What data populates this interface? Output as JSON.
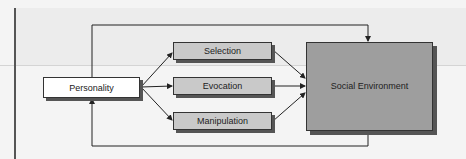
{
  "diagram": {
    "nodes": {
      "personality": "Personality",
      "selection": "Selection",
      "evocation": "Evocation",
      "manipulation": "Manipulation",
      "social_environment": "Social Environment"
    },
    "edges": [
      {
        "from": "Personality",
        "to": "Selection"
      },
      {
        "from": "Personality",
        "to": "Evocation"
      },
      {
        "from": "Personality",
        "to": "Manipulation"
      },
      {
        "from": "Selection",
        "to": "Social Environment"
      },
      {
        "from": "Evocation",
        "to": "Social Environment"
      },
      {
        "from": "Manipulation",
        "to": "Social Environment"
      },
      {
        "from": "Personality",
        "to": "Social Environment",
        "route": "top"
      },
      {
        "from": "Social Environment",
        "to": "Personality",
        "route": "bottom"
      }
    ],
    "colors": {
      "personality_fill": "#ffffff",
      "mechanism_fill": "#c9c9c9",
      "environment_fill": "#9e9e9e",
      "line": "#222222"
    }
  }
}
